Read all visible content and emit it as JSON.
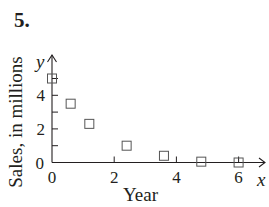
{
  "problem": {
    "number": "5."
  },
  "chart_data": {
    "type": "scatter",
    "title": "",
    "xlabel": "Year",
    "ylabel": "Sales, in millions",
    "x_axis_letter": "x",
    "y_axis_letter": "y",
    "xlim": [
      0,
      6.6
    ],
    "ylim": [
      0,
      5.4
    ],
    "x_ticks": [
      0,
      2,
      4,
      6
    ],
    "x_tick_labels": [
      "0",
      "2",
      "4",
      "6"
    ],
    "y_ticks": [
      0,
      1,
      2,
      3,
      4,
      5
    ],
    "y_tick_labels": [
      "0",
      "",
      "2",
      "",
      "4",
      ""
    ],
    "grid": false,
    "marker": "open-square",
    "series": [
      {
        "name": "Sales",
        "points": [
          {
            "x": 0,
            "y": 5.0
          },
          {
            "x": 0.6,
            "y": 3.5
          },
          {
            "x": 1.2,
            "y": 2.3
          },
          {
            "x": 2.4,
            "y": 1.0
          },
          {
            "x": 3.6,
            "y": 0.4
          },
          {
            "x": 4.8,
            "y": 0.05
          },
          {
            "x": 6.0,
            "y": 0.0
          }
        ]
      }
    ]
  }
}
